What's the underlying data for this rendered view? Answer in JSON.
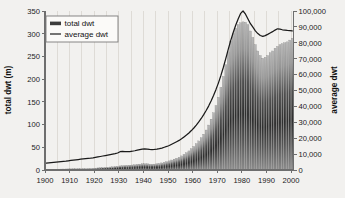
{
  "chart_data": {
    "type": "bar",
    "title": "",
    "subtitle": "",
    "xlabel": "",
    "ylabel": "total dwt (m)",
    "y2label": "average dwt",
    "xlim": [
      1900,
      2001
    ],
    "ylim": [
      0,
      350
    ],
    "y2lim": [
      0,
      100000
    ],
    "grid": "vertical-only",
    "legend_position": "top-left",
    "x_ticks": [
      "1900",
      "1910",
      "1920",
      "1930",
      "1940",
      "1950",
      "1960",
      "1970",
      "1980",
      "1990",
      "2000"
    ],
    "x_tick_values": [
      1900,
      1910,
      1920,
      1930,
      1940,
      1950,
      1960,
      1970,
      1980,
      1990,
      2000
    ],
    "y_ticks": [
      "0",
      "50",
      "100",
      "150",
      "200",
      "250",
      "300",
      "350"
    ],
    "y_tick_values": [
      0,
      50,
      100,
      150,
      200,
      250,
      300,
      350
    ],
    "y2_ticks": [
      "0",
      "10,000",
      "20,000",
      "30,000",
      "40,000",
      "50,000",
      "60,000",
      "70,000",
      "80,000",
      "90,000",
      "100,000"
    ],
    "y2_tick_values": [
      0,
      10000,
      20000,
      30000,
      40000,
      50000,
      60000,
      70000,
      80000,
      90000,
      100000
    ],
    "legend": [
      {
        "label": "total dwt",
        "marker": "bar",
        "color": "#4a4a4a"
      },
      {
        "label": "average dwt",
        "marker": "line",
        "color": "#1a1a1a"
      }
    ],
    "x": [
      1900,
      1901,
      1902,
      1903,
      1904,
      1905,
      1906,
      1907,
      1908,
      1909,
      1910,
      1911,
      1912,
      1913,
      1914,
      1915,
      1916,
      1917,
      1918,
      1919,
      1920,
      1921,
      1922,
      1923,
      1924,
      1925,
      1926,
      1927,
      1928,
      1929,
      1930,
      1931,
      1932,
      1933,
      1934,
      1935,
      1936,
      1937,
      1938,
      1939,
      1940,
      1941,
      1942,
      1943,
      1944,
      1945,
      1946,
      1947,
      1948,
      1949,
      1950,
      1951,
      1952,
      1953,
      1954,
      1955,
      1956,
      1957,
      1958,
      1959,
      1960,
      1961,
      1962,
      1963,
      1964,
      1965,
      1966,
      1967,
      1968,
      1969,
      1970,
      1971,
      1972,
      1973,
      1974,
      1975,
      1976,
      1977,
      1978,
      1979,
      1980,
      1981,
      1982,
      1983,
      1984,
      1985,
      1986,
      1987,
      1988,
      1989,
      1990,
      1991,
      1992,
      1993,
      1994,
      1995,
      1996,
      1997,
      1998,
      1999,
      2000
    ],
    "series": [
      {
        "name": "total dwt",
        "axis": "left",
        "unit": "million dwt",
        "values": [
          1.5,
          1.6,
          1.7,
          1.8,
          1.9,
          2.0,
          2.1,
          2.2,
          2.3,
          2.4,
          2.6,
          2.7,
          2.9,
          3.0,
          3.1,
          3.2,
          3.3,
          3.4,
          3.6,
          3.8,
          4.2,
          4.6,
          5.0,
          5.4,
          5.8,
          6.2,
          6.6,
          7.0,
          7.6,
          8.2,
          9.0,
          9.6,
          10.0,
          10.2,
          10.6,
          11.0,
          11.6,
          12.4,
          13.0,
          13.6,
          14.0,
          13.6,
          13.0,
          12.6,
          13.0,
          13.6,
          14.4,
          15.6,
          17.0,
          18.4,
          20.0,
          22.0,
          24.0,
          26.0,
          28.0,
          31.0,
          34.5,
          38.0,
          42.0,
          47.0,
          52.0,
          58.0,
          64.0,
          71.0,
          79.0,
          88.0,
          99.0,
          112.0,
          126.0,
          142.0,
          160.0,
          182.0,
          206.0,
          232.0,
          260.0,
          284.0,
          300.0,
          312.0,
          320.0,
          324.0,
          326.0,
          325.0,
          320.0,
          306.0,
          292.0,
          276.0,
          262.0,
          252.0,
          246.0,
          248.0,
          252.0,
          258.0,
          262.0,
          268.0,
          272.0,
          276.0,
          278.0,
          280.0,
          282.0,
          286.0,
          290.0
        ]
      },
      {
        "name": "average dwt",
        "axis": "right",
        "unit": "dwt",
        "values": [
          4300,
          4500,
          4700,
          4850,
          5000,
          5150,
          5300,
          5450,
          5600,
          5800,
          6000,
          6200,
          6400,
          6600,
          6800,
          6950,
          7100,
          7250,
          7400,
          7600,
          7900,
          8200,
          8500,
          8800,
          9100,
          9400,
          9700,
          10000,
          10300,
          10700,
          11500,
          11700,
          11600,
          11500,
          11600,
          11800,
          12100,
          12500,
          12800,
          13100,
          13300,
          13100,
          12900,
          12800,
          12900,
          13100,
          13400,
          13800,
          14300,
          14800,
          15400,
          16200,
          17000,
          17800,
          18600,
          19600,
          20800,
          22000,
          23300,
          24800,
          26400,
          28200,
          30200,
          32400,
          34800,
          37400,
          40200,
          43400,
          46900,
          50700,
          54800,
          59500,
          64600,
          70200,
          76000,
          81500,
          86500,
          91000,
          95000,
          98500,
          100000,
          98000,
          95000,
          92000,
          89800,
          87500,
          85800,
          84600,
          84000,
          84500,
          85300,
          86200,
          87000,
          88000,
          88800,
          88600,
          88200,
          88000,
          87800,
          87700,
          87500
        ]
      }
    ]
  }
}
